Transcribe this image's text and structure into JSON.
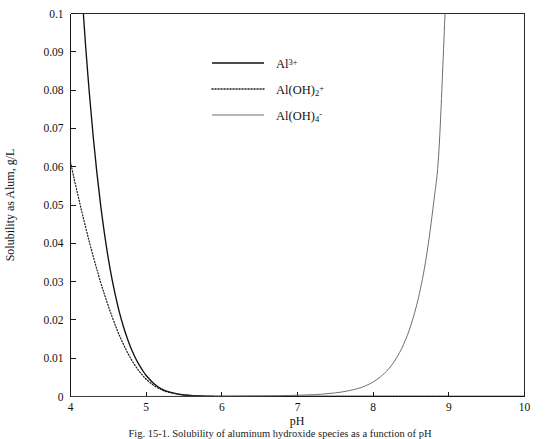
{
  "chart_data": {
    "type": "line",
    "title": "",
    "xlabel": "pH",
    "ylabel": "Solubility as Alum, g/L",
    "xlim": [
      4,
      10
    ],
    "ylim": [
      0,
      0.1
    ],
    "grid": false,
    "legend_position": "top-center",
    "xticks": [
      "4",
      "5",
      "6",
      "7",
      "8",
      "9",
      "10"
    ],
    "xtick_values": [
      4,
      5,
      6,
      7,
      8,
      9,
      10
    ],
    "yticks": [
      "0",
      "0.01",
      "0.02",
      "0.03",
      "0.04",
      "0.05",
      "0.06",
      "0.07",
      "0.08",
      "0.09",
      "0.1"
    ],
    "ytick_values": [
      0,
      0.01,
      0.02,
      0.03,
      0.04,
      0.05,
      0.06,
      0.07,
      0.08,
      0.09,
      0.1
    ],
    "series": [
      {
        "name": "Al3+",
        "label_html": "Al<sup>3+</sup>",
        "style": "solid",
        "color": "#111111",
        "x": [
          4.17,
          4.2,
          4.25,
          4.3,
          4.35,
          4.4,
          4.45,
          4.5,
          4.55,
          4.6,
          4.65,
          4.7,
          4.75,
          4.8,
          4.85,
          4.9,
          4.95,
          5.0,
          5.1,
          5.2,
          5.3,
          5.5,
          5.8,
          6.2,
          7.0,
          8.0,
          9.0,
          10.0
        ],
        "y": [
          0.1,
          0.0915,
          0.079,
          0.0679,
          0.0582,
          0.0497,
          0.0424,
          0.036,
          0.0305,
          0.0258,
          0.0217,
          0.0182,
          0.0152,
          0.0126,
          0.0104,
          0.0085,
          0.0069,
          0.0055,
          0.0034,
          0.002,
          0.0012,
          0.0004,
          0.0001,
          3e-05,
          1e-05,
          1e-05,
          1e-05,
          1e-05
        ]
      },
      {
        "name": "Al(OH)2+",
        "label_html": "Al(OH)<sub>2</sub><sup>+</sup>",
        "style": "dotted",
        "color": "#222222",
        "x": [
          4.0,
          4.05,
          4.1,
          4.15,
          4.2,
          4.25,
          4.3,
          4.35,
          4.4,
          4.45,
          4.5,
          4.55,
          4.6,
          4.65,
          4.7,
          4.75,
          4.8,
          4.85,
          4.9,
          4.95,
          5.0,
          5.1,
          5.2,
          5.3,
          5.5,
          5.8,
          6.2,
          6.6,
          7.0,
          7.4,
          7.8,
          8.2,
          8.6,
          9.0
        ],
        "y": [
          0.0612,
          0.0567,
          0.0524,
          0.0482,
          0.0442,
          0.0403,
          0.0366,
          0.0331,
          0.0297,
          0.0266,
          0.0236,
          0.0208,
          0.0182,
          0.0158,
          0.0136,
          0.0116,
          0.0098,
          0.0082,
          0.0068,
          0.0056,
          0.0045,
          0.0029,
          0.0018,
          0.0011,
          0.0004,
          0.0001,
          4e-05,
          2e-05,
          2e-05,
          2e-05,
          2e-05,
          2e-05,
          2e-05,
          2e-05
        ]
      },
      {
        "name": "Al(OH)4-",
        "label_html": "Al(OH)<sub>4</sub><sup>-</sup>",
        "style": "thin",
        "color": "#6e6e6e",
        "x": [
          4.0,
          5.0,
          5.5,
          6.0,
          6.3,
          6.6,
          6.8,
          7.0,
          7.2,
          7.35,
          7.5,
          7.65,
          7.8,
          7.9,
          8.0,
          8.1,
          8.2,
          8.3,
          8.4,
          8.5,
          8.6,
          8.7,
          8.8,
          8.87,
          8.95
        ],
        "y": [
          1e-05,
          2e-05,
          3e-05,
          6e-05,
          0.0001,
          0.00016,
          0.00023,
          0.00032,
          0.00048,
          0.00066,
          0.00095,
          0.0014,
          0.0021,
          0.0028,
          0.0038,
          0.0052,
          0.0071,
          0.0098,
          0.0135,
          0.0187,
          0.0259,
          0.0361,
          0.0507,
          0.0645,
          0.1
        ]
      }
    ]
  },
  "legend": {
    "entries": [
      {
        "label": "Al3+",
        "style": "solid"
      },
      {
        "label": "Al(OH)2+",
        "style": "dotted"
      },
      {
        "label": "Al(OH)4-",
        "style": "thin"
      }
    ]
  },
  "caption": {
    "text": "Fig. 15-1. Solubility of aluminum hydroxide species as a function of pH"
  }
}
